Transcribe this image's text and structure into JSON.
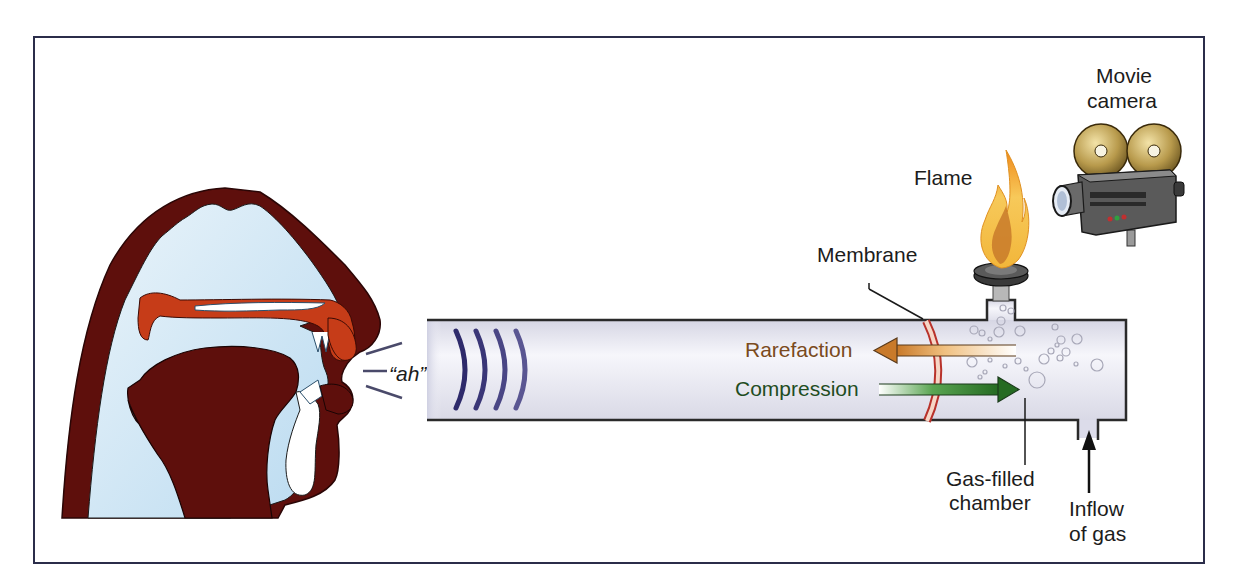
{
  "diagram": {
    "labels": {
      "sound": "“ah”",
      "rarefaction": "Rarefaction",
      "compression": "Compression",
      "membrane": "Membrane",
      "flame": "Flame",
      "camera_line1": "Movie",
      "camera_line2": "camera",
      "chamber_line1": "Gas-filled",
      "chamber_line2": "chamber",
      "inflow_line1": "Inflow",
      "inflow_line2": "of gas"
    },
    "components": [
      {
        "name": "head-cross-section",
        "icon": "vocal-tract-icon"
      },
      {
        "name": "sound-waves",
        "count": 4
      },
      {
        "name": "tube"
      },
      {
        "name": "membrane"
      },
      {
        "name": "rarefaction-arrow",
        "direction": "left"
      },
      {
        "name": "compression-arrow",
        "direction": "right"
      },
      {
        "name": "flame-burner",
        "icon": "flame-icon"
      },
      {
        "name": "movie-camera",
        "icon": "movie-camera-icon"
      },
      {
        "name": "gas-inlet",
        "icon": "arrow-up-icon"
      }
    ],
    "colors": {
      "frame": "#2b2d4a",
      "head_dark": "#5e0f0c",
      "head_light": "#cfe6f3",
      "palate_orange": "#c63c18",
      "tube_fill": "#e8e8f0",
      "wave": "#2e2a6b",
      "membrane": "#b8322b",
      "rarefaction_text": "#7a4a20",
      "rarefaction_arrow": "#d88c3a",
      "compression_text": "#1f4d1f",
      "compression_arrow": "#2f7d2a",
      "flame": "#f5a623"
    }
  }
}
